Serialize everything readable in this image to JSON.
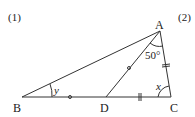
{
  "problem_labels": {
    "first": "(1)",
    "second": "(2)"
  },
  "figure": {
    "vertices": {
      "A": "A",
      "B": "B",
      "C": "C",
      "D": "D"
    },
    "angle_A": "50°",
    "angle_C": "x",
    "angle_B": "y",
    "marks": {
      "BD_AD_equal": "single circle tick marks on BD and AD",
      "DC_AC_equal": "double tick marks on DC and AC"
    }
  }
}
